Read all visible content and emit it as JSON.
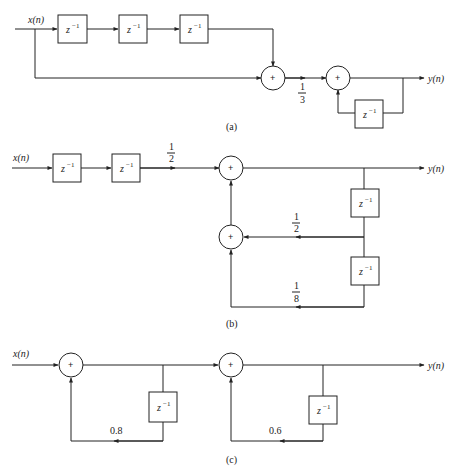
{
  "diagrams": [
    {
      "caption": "(a)",
      "input_label": "x(n)",
      "output_label": "y(n)",
      "delay_label": "z",
      "delay_exp": "−1",
      "gains": {
        "scale": {
          "num": "1",
          "den": "3"
        }
      },
      "adder_symbol": "+"
    },
    {
      "caption": "(b)",
      "input_label": "x(n)",
      "output_label": "y(n)",
      "delay_label": "z",
      "delay_exp": "−1",
      "gains": {
        "input": {
          "num": "1",
          "den": "2"
        },
        "fb1": {
          "num": "1",
          "den": "2"
        },
        "fb2": {
          "num": "1",
          "den": "8"
        }
      },
      "adder_symbol": "+"
    },
    {
      "caption": "(c)",
      "input_label": "x(n)",
      "output_label": "y(n)",
      "delay_label": "z",
      "delay_exp": "−1",
      "gains": {
        "fb1": "0.8",
        "fb2": "0.6"
      },
      "adder_symbol": "+"
    }
  ]
}
